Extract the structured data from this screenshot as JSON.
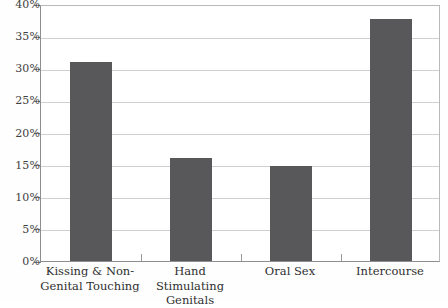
{
  "chart_data": {
    "type": "bar",
    "title": "",
    "subtitle": "",
    "xlabel": "",
    "ylabel": "",
    "categories": [
      "Kissing & Non-\nGenital Touching",
      "Hand Stimulating\nGenitals",
      "Oral Sex",
      "Intercourse"
    ],
    "values": [
      31.0,
      16.0,
      14.8,
      37.7
    ],
    "value_labels": [
      "31%",
      "16%",
      "14.8%",
      "37.7%"
    ],
    "ylim": [
      0,
      40
    ],
    "ytick_values": [
      0,
      5,
      10,
      15,
      20,
      25,
      30,
      35,
      40
    ],
    "ytick_labels": [
      "0%",
      "5%",
      "10%",
      "15%",
      "20%",
      "25%",
      "30%",
      "35%",
      "40%"
    ],
    "grid": true,
    "grid_axis": "y",
    "legend": false,
    "legend_position": "none",
    "bar_color": "#58585a",
    "grid_color": "#cfcfd1",
    "axis_color": "#8d8d8f",
    "background_color": "#ffffff"
  },
  "figure": {
    "caption_fragment": ""
  }
}
